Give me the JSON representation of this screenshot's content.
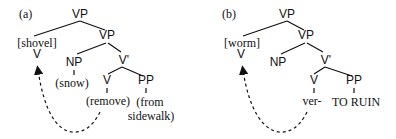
{
  "panels": [
    {
      "label": "(a)",
      "nodes": {
        "root": "VP",
        "moved_verb_gloss": "[shovel]",
        "moved_verb_cat": "V",
        "vp2": "VP",
        "np": "NP",
        "np_word": "(snow)",
        "vbar": "V'",
        "v": "V",
        "v_word": "(remove)",
        "pp": "PP",
        "pp_word_line1": "(from",
        "pp_word_line2": "sidewalk)"
      }
    },
    {
      "label": "(b)",
      "nodes": {
        "root": "VP",
        "moved_verb_gloss": "[worm]",
        "moved_verb_cat": "V",
        "vp2": "VP",
        "np": "NP",
        "vbar": "V'",
        "v": "V",
        "v_word": "ver-",
        "pp": "PP",
        "pp_word": "TO RUIN"
      }
    }
  ],
  "arrow_style": "dashed curved arrow from lower V up to moved V",
  "colors": {
    "ink": "#111111",
    "background": "#ffffff"
  }
}
